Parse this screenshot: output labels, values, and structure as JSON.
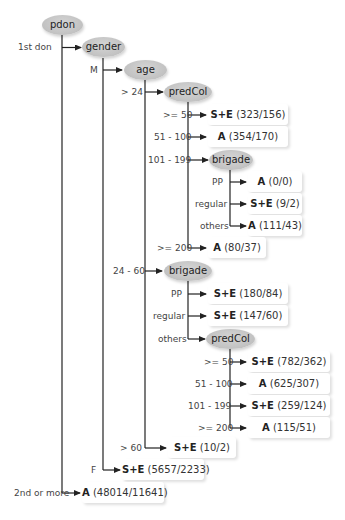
{
  "diagram": {
    "type": "decision-tree",
    "nodes": {
      "pdon": "pdon",
      "gender": "gender",
      "age": "age",
      "predCol_1": "predCol",
      "brigade_1": "brigade",
      "brigade_2": "brigade",
      "predCol_2": "predCol"
    },
    "edges": {
      "first_don": "1st don",
      "second_or_more": "2nd or more",
      "male": "M",
      "female": "F",
      "age_gt24": "> 24",
      "age_24_60": "24 - 60",
      "age_gt60": "> 60",
      "p1_ge50": ">= 50",
      "p1_51_100": "51 - 100",
      "p1_101_199": "101 - 199",
      "p1_ge200": ">= 200",
      "b1_pp": "PP",
      "b1_regular": "regular",
      "b1_others": "others",
      "b2_pp": "PP",
      "b2_regular": "regular",
      "b2_others": "others",
      "p2_ge50": ">= 50",
      "p2_51_100": "51 - 100",
      "p2_101_199": "101 - 199",
      "p2_ge200": ">= 200"
    },
    "leaves": {
      "p1_ge50": {
        "class": "S+E",
        "counts": "(323/156)"
      },
      "p1_51_100": {
        "class": "A",
        "counts": "(354/170)"
      },
      "b1_pp": {
        "class": "A",
        "counts": "(0/0)"
      },
      "b1_regular": {
        "class": "S+E",
        "counts": "(9/2)"
      },
      "b1_others": {
        "class": "A",
        "counts": "(111/43)"
      },
      "p1_ge200": {
        "class": "A",
        "counts": "(80/37)"
      },
      "b2_pp": {
        "class": "S+E",
        "counts": "(180/84)"
      },
      "b2_regular": {
        "class": "S+E",
        "counts": "(147/60)"
      },
      "p2_ge50": {
        "class": "S+E",
        "counts": "(782/362)"
      },
      "p2_51_100": {
        "class": "A",
        "counts": "(625/307)"
      },
      "p2_101_199": {
        "class": "S+E",
        "counts": "(259/124)"
      },
      "p2_ge200": {
        "class": "A",
        "counts": "(115/51)"
      },
      "age_gt60": {
        "class": "S+E",
        "counts": "(10/2)"
      },
      "female": {
        "class": "S+E",
        "counts": "(5657/2233)"
      },
      "second_or_more": {
        "class": "A",
        "counts": "(48014/11641)"
      }
    },
    "colors": {
      "node_fill": "#c4c4c4",
      "edge": "#222222",
      "leaf_bg": "#ffffff"
    }
  }
}
